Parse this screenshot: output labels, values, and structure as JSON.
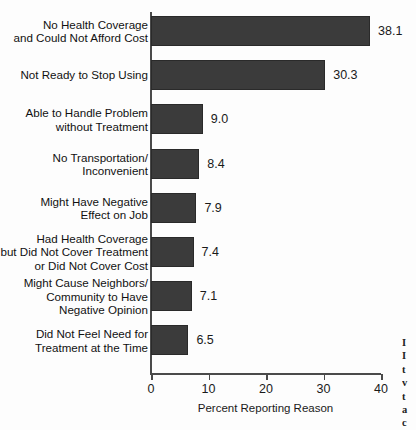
{
  "chart_data": {
    "type": "bar",
    "orientation": "horizontal",
    "title": "",
    "xlabel": "Percent Reporting Reason",
    "ylabel": "",
    "xlim": [
      0,
      40
    ],
    "xticks": [
      0,
      10,
      20,
      30,
      40
    ],
    "xtick_labels": [
      "0",
      "10",
      "20",
      "30",
      "40"
    ],
    "grid": false,
    "legend": false,
    "bar_color": "#3b3b3b",
    "categories": [
      "No Health Coverage\nand Could Not Afford Cost",
      "Not Ready to Stop Using",
      "Able to Handle Problem\nwithout Treatment",
      "No Transportation/\nInconvenient",
      "Might Have Negative\nEffect on Job",
      "Had Health Coverage\nbut Did Not Cover Treatment\nor Did Not Cover Cost",
      "Might Cause Neighbors/\nCommunity to Have\nNegative Opinion",
      "Did Not Feel Need for\nTreatment at the Time"
    ],
    "values": [
      38.1,
      30.3,
      9.0,
      8.4,
      7.9,
      7.4,
      7.1,
      6.5
    ],
    "value_labels": [
      "38.1",
      "30.3",
      "9.0",
      "8.4",
      "7.9",
      "7.4",
      "7.1",
      "6.5"
    ]
  },
  "margin_fragment": {
    "lines": [
      "I",
      "I",
      "t",
      "v",
      "t",
      "a",
      "c"
    ]
  }
}
